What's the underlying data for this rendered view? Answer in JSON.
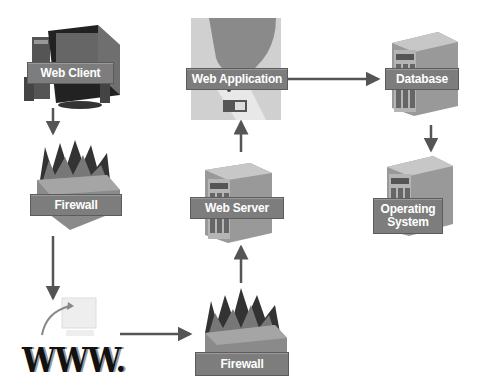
{
  "diagram": {
    "type": "network-architecture",
    "nodes": {
      "web_client": {
        "label": "Web Client",
        "icon": "desktop-computer-icon"
      },
      "firewall_left": {
        "label": "Firewall",
        "icon": "firewall-icon"
      },
      "internet": {
        "label": "WWW.",
        "icon": "internet-computer-icon"
      },
      "firewall_bottom": {
        "label": "Firewall",
        "icon": "firewall-icon"
      },
      "web_server": {
        "label": "Web Server",
        "icon": "server-tower-icon"
      },
      "web_application": {
        "label": "Web Application",
        "icon": "web-application-icon"
      },
      "database": {
        "label": "Database",
        "icon": "server-tower-icon"
      },
      "operating_system": {
        "label": "Operating\nSystem",
        "label_line1": "Operating",
        "label_line2": "System",
        "icon": "server-tower-icon"
      }
    },
    "edges": [
      {
        "from": "Web Client",
        "to": "Firewall"
      },
      {
        "from": "Firewall",
        "to": "WWW."
      },
      {
        "from": "WWW.",
        "to": "Firewall"
      },
      {
        "from": "Firewall",
        "to": "Web Server"
      },
      {
        "from": "Web Server",
        "to": "Web Application"
      },
      {
        "from": "Web Application",
        "to": "Database"
      },
      {
        "from": "Database",
        "to": "Operating System"
      }
    ],
    "colors": {
      "label_bg": "#7d7d7d",
      "label_text": "#ffffff",
      "arrow": "#555555"
    }
  }
}
